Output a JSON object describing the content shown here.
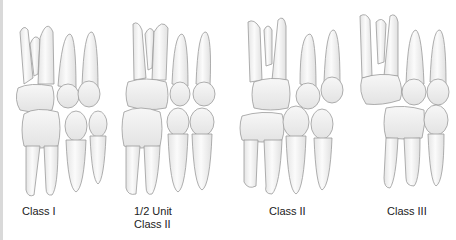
{
  "figure": {
    "panels": [
      {
        "id": "class-1",
        "label_lines": [
          "Class I"
        ]
      },
      {
        "id": "half-unit-class-2",
        "label_lines": [
          "1/2 Unit",
          "Class II"
        ]
      },
      {
        "id": "class-2",
        "label_lines": [
          "Class II"
        ]
      },
      {
        "id": "class-3",
        "label_lines": [
          "Class III"
        ]
      }
    ]
  },
  "colors": {
    "tooth_fill": "#f2f2f2",
    "tooth_outline": "#9a9a9a",
    "label_text": "#222222",
    "left_edge": "#d9d9d9"
  }
}
